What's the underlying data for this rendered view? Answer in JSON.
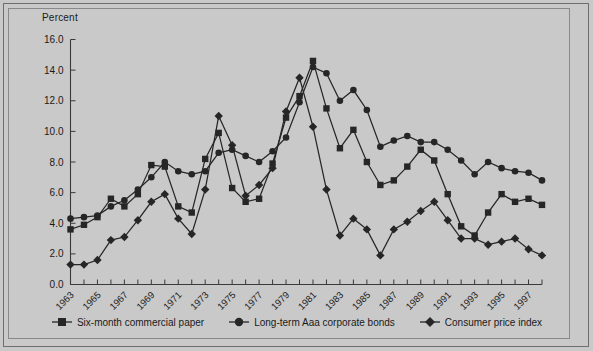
{
  "figure": {
    "axis_title": "Percent",
    "background_color": "#c9c9c9",
    "line_color": "#262626",
    "axis_color": "#3a3a3a"
  },
  "legend": {
    "position": "bottom-center",
    "items": [
      {
        "label": "Six-month commercial paper",
        "marker": "square-marker"
      },
      {
        "label": "Long-term Aaa corporate bonds",
        "marker": "circle-marker"
      },
      {
        "label": "Consumer price index",
        "marker": "diamond-marker"
      }
    ]
  },
  "chart_data": {
    "type": "line",
    "title": "",
    "subtitle": "",
    "xlabel": "",
    "ylabel": "Percent",
    "grid": false,
    "legend_position": "bottom",
    "xlim": [
      1963,
      1998
    ],
    "ylim": [
      0.0,
      16.0
    ],
    "ytick_step": 2.0,
    "ytick_labels": [
      "0.0",
      "2.0",
      "4.0",
      "6.0",
      "8.0",
      "10.0",
      "12.0",
      "14.0",
      "16.0"
    ],
    "xtick_labels": [
      "1963",
      "1965",
      "1967",
      "1969",
      "1971",
      "1973",
      "1975",
      "1977",
      "1979",
      "1981",
      "1983",
      "1985",
      "1987",
      "1989",
      "1991",
      "1993",
      "1995",
      "1997"
    ],
    "xtick_label_step_years": 2,
    "x": [
      1963,
      1964,
      1965,
      1966,
      1967,
      1968,
      1969,
      1970,
      1971,
      1972,
      1973,
      1974,
      1975,
      1976,
      1977,
      1978,
      1979,
      1980,
      1981,
      1982,
      1983,
      1984,
      1985,
      1986,
      1987,
      1988,
      1989,
      1990,
      1991,
      1992,
      1993,
      1994,
      1995,
      1996,
      1997,
      1998
    ],
    "series": [
      {
        "name": "Six-month commercial paper",
        "marker": "square-marker",
        "values": [
          3.6,
          3.9,
          4.4,
          5.6,
          5.1,
          5.9,
          7.8,
          7.7,
          5.1,
          4.7,
          8.2,
          9.9,
          6.3,
          5.4,
          5.6,
          7.9,
          10.9,
          12.3,
          14.6,
          11.5,
          8.9,
          10.1,
          8.0,
          6.5,
          6.8,
          7.7,
          8.8,
          8.1,
          5.9,
          3.8,
          3.2,
          4.7,
          5.9,
          5.4,
          5.6,
          5.2
        ]
      },
      {
        "name": "Long-term Aaa corporate bonds",
        "marker": "circle-marker",
        "values": [
          4.3,
          4.4,
          4.5,
          5.1,
          5.5,
          6.2,
          7.0,
          8.0,
          7.4,
          7.2,
          7.4,
          8.6,
          8.8,
          8.4,
          8.0,
          8.7,
          9.6,
          11.9,
          14.2,
          13.8,
          12.0,
          12.7,
          11.4,
          9.0,
          9.4,
          9.7,
          9.3,
          9.3,
          8.8,
          8.1,
          7.2,
          8.0,
          7.6,
          7.4,
          7.3,
          6.8
        ]
      },
      {
        "name": "Consumer price index",
        "marker": "diamond-marker",
        "values": [
          1.3,
          1.3,
          1.6,
          2.9,
          3.1,
          4.2,
          5.4,
          5.9,
          4.3,
          3.3,
          6.2,
          11.0,
          9.1,
          5.8,
          6.5,
          7.6,
          11.3,
          13.5,
          10.3,
          6.2,
          3.2,
          4.3,
          3.6,
          1.9,
          3.6,
          4.1,
          4.8,
          5.4,
          4.2,
          3.0,
          3.0,
          2.6,
          2.8,
          3.0,
          2.3,
          1.9
        ]
      }
    ]
  }
}
